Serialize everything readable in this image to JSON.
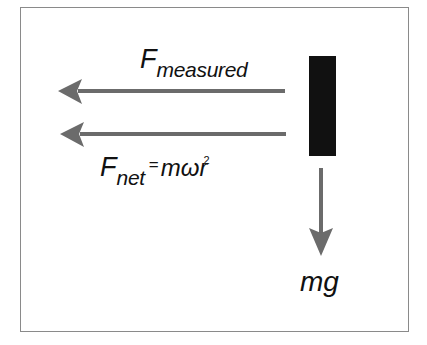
{
  "diagram": {
    "colors": {
      "arrow": "#6b6b6b",
      "block": "#111111",
      "frame_border": "#8a8a8a",
      "text": "#111111",
      "background": "#ffffff"
    },
    "labels": {
      "f_measured": {
        "main": "F",
        "subscript": "measured"
      },
      "f_net": {
        "main": "F",
        "subscript": "net",
        "equals": "=",
        "rhs": "mωr",
        "superscript": "2"
      },
      "gravity": {
        "text": "mg"
      }
    },
    "arrows": [
      {
        "name": "f-measured-arrow",
        "direction": "left",
        "from": [
          285,
          91
        ],
        "to": [
          58,
          91
        ]
      },
      {
        "name": "f-net-arrow",
        "direction": "left",
        "from": [
          286,
          134
        ],
        "to": [
          60,
          134
        ]
      },
      {
        "name": "gravity-arrow",
        "direction": "down",
        "from": [
          321,
          168
        ],
        "to": [
          321,
          256
        ]
      }
    ],
    "block": {
      "name": "mass-block",
      "x": 309,
      "y": 56,
      "width": 27,
      "height": 100
    }
  }
}
